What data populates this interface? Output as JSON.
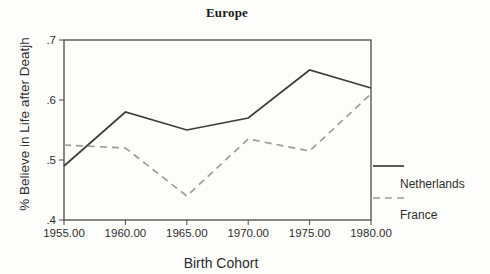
{
  "figure": {
    "background_color": "#fdfdfc",
    "axis_color": "#4a4a4a",
    "text_color": "#2e2e2e"
  },
  "chart_data": {
    "type": "line",
    "title": "Europe",
    "xlabel": "Birth Cohort",
    "ylabel": "% Believe in Life after Deatjh",
    "x": [
      1955,
      1960,
      1965,
      1970,
      1975,
      1980
    ],
    "x_tick_labels": [
      "1955.00",
      "1960.00",
      "1965.00",
      "1970.00",
      "1975.00",
      "1980.00"
    ],
    "y_tick_labels": [
      ".4",
      ".5",
      ".6",
      ".7"
    ],
    "ylim": [
      0.4,
      0.7
    ],
    "grid": false,
    "legend_position": "right-bottom",
    "series": [
      {
        "name": "Netherlands",
        "line_style": "solid",
        "color": "#3c3c3c",
        "values": [
          0.49,
          0.58,
          0.55,
          0.57,
          0.65,
          0.62
        ]
      },
      {
        "name": "France",
        "line_style": "dashed",
        "color": "#9c9c9c",
        "values": [
          0.525,
          0.52,
          0.44,
          0.535,
          0.515,
          0.61
        ]
      }
    ]
  }
}
